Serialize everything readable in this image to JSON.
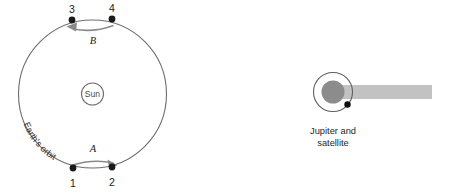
{
  "figure": {
    "background_color": "#ffffff",
    "width": 451,
    "height": 193
  },
  "earth_orbit_diagram": {
    "orbit_caption": "Earth's orbit",
    "center_label": "Sun",
    "orbit": {
      "center_x": 92.5,
      "center_y": 94,
      "radius": 74,
      "stroke_color": "#6e6e6e"
    },
    "sun": {
      "center_x": 92.5,
      "center_y": 94,
      "radius": 11,
      "stroke_color": "#6e6e6e"
    },
    "positions": [
      {
        "label": "1",
        "x": 73,
        "y": 168,
        "label_x": 73,
        "label_y": 186
      },
      {
        "label": "2",
        "x": 112,
        "y": 167,
        "label_x": 112,
        "label_y": 185
      },
      {
        "label": "3",
        "x": 72,
        "y": 20,
        "label_x": 72,
        "label_y": 12
      },
      {
        "label": "4",
        "x": 112,
        "y": 19,
        "label_x": 112,
        "label_y": 11
      }
    ],
    "motion_arrows": [
      {
        "label": "A",
        "direction": "right",
        "label_x": 93,
        "label_y": 152
      },
      {
        "label": "B",
        "direction": "left",
        "label_x": 93,
        "label_y": 44
      }
    ],
    "arrow_color": "#8a8a8a",
    "dot_color": "#1a1a1a"
  },
  "jupiter_diagram": {
    "caption_line_1": "Jupiter and",
    "caption_line_2": "satellite",
    "jupiter": {
      "center_x": 333,
      "center_y": 92,
      "radius": 11.5,
      "fill_color": "#8c8c8c"
    },
    "satellite_orbit": {
      "center_x": 333,
      "center_y": 92,
      "radius": 19.5,
      "stroke_color": "#5f5f5f"
    },
    "satellite": {
      "x": 347.5,
      "y": 104.5,
      "radius": 3.2,
      "fill_color": "#101010"
    },
    "shadow_band": {
      "x": 333,
      "y": 85,
      "width": 99,
      "height": 14,
      "fill_color": "#c2c2c2"
    }
  }
}
